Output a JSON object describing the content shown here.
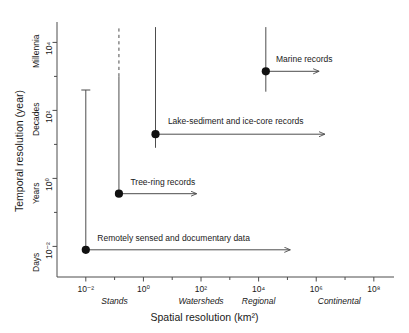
{
  "chart_data": {
    "type": "scatter",
    "title": "",
    "xlabel": "Spatial resolution (km²)",
    "ylabel": "Temporal resolution (year)",
    "xscale": "log",
    "yscale": "log",
    "xlim": [
      -3,
      8.7
    ],
    "ylim": [
      -2.9,
      4.6
    ],
    "grid": false,
    "legend": "none",
    "x_ticks": [
      {
        "exp": "-2",
        "base": "10",
        "value": -2,
        "label": "10⁻²"
      },
      {
        "exp": "0",
        "base": "10",
        "value": 0,
        "label": "10⁰"
      },
      {
        "exp": "2",
        "base": "10",
        "value": 2,
        "label": "10²"
      },
      {
        "exp": "4",
        "base": "10",
        "value": 4,
        "label": "10⁴"
      },
      {
        "exp": "6",
        "base": "10",
        "value": 6,
        "label": "10⁶"
      },
      {
        "exp": "8",
        "base": "10",
        "value": 8,
        "label": "10⁸"
      }
    ],
    "x_minor_ticks": [
      -1,
      1,
      3,
      5,
      7
    ],
    "x_category_labels": [
      {
        "text": "Stands",
        "value": -1.0
      },
      {
        "text": "Watersheds",
        "value": 2.0
      },
      {
        "text": "Regional",
        "value": 4.0
      },
      {
        "text": "Continental",
        "value": 6.8
      }
    ],
    "y_ticks": [
      {
        "exp": "-2",
        "value": -2,
        "label": "10⁻²"
      },
      {
        "exp": "0",
        "value": 0,
        "label": "10⁰"
      },
      {
        "exp": "2",
        "value": 2,
        "label": "10²"
      },
      {
        "exp": "4",
        "value": 4,
        "label": "10⁴"
      }
    ],
    "y_minor_ticks": [
      -1,
      1,
      3
    ],
    "y_category_labels": [
      {
        "text": "Days",
        "value": -2.0
      },
      {
        "text": "Years",
        "value": 0.0
      },
      {
        "text": "Decades",
        "value": 2.0
      },
      {
        "text": "Millennia",
        "value": 4.0
      }
    ],
    "points": [
      {
        "name": "Remotely sensed and documentary data",
        "x": -2.0,
        "y": -2.1,
        "y_err_low": -2.1,
        "y_err_high_solid": 2.6,
        "y_err_high_dashed": null,
        "cap_top": true,
        "arrow_x_end": 5.1,
        "label_x": -1.6,
        "label_y": -1.75
      },
      {
        "name": "Tree-ring records",
        "x": -0.85,
        "y": -0.45,
        "y_err_low": -0.45,
        "y_err_high_solid": 3.0,
        "y_err_high_dashed": 4.45,
        "cap_top": false,
        "arrow_x_end": 1.85,
        "label_x": -0.45,
        "label_y": -0.1
      },
      {
        "name": "Lake-sediment and ice-core records",
        "x": 0.42,
        "y": 1.3,
        "y_err_low": 0.9,
        "y_err_high_solid": 4.45,
        "y_err_high_dashed": null,
        "cap_top": false,
        "arrow_x_end": 6.3,
        "label_x": 0.85,
        "label_y": 1.68
      },
      {
        "name": "Marine records",
        "x": 4.25,
        "y": 3.15,
        "y_err_low": 2.55,
        "y_err_high_solid": 4.45,
        "y_err_high_dashed": null,
        "cap_top": false,
        "arrow_x_end": 6.1,
        "label_x": 4.6,
        "label_y": 3.5
      }
    ],
    "colors": {
      "axis": "#4d4d4d",
      "marker": "#111111",
      "line": "#4d4d4d",
      "text": "#1a1a1a",
      "background": "#ffffff"
    }
  },
  "axes": {
    "xlabel": "Spatial resolution (km²)",
    "ylabel": "Temporal resolution (year)"
  }
}
